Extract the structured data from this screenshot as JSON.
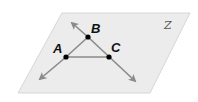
{
  "diagram": {
    "type": "geometry",
    "plane": {
      "label": "Z",
      "fill": "#ececec",
      "stroke": "#d0d0d0",
      "corners": [
        [
          62,
          13
        ],
        [
          190,
          13
        ],
        [
          150,
          93
        ],
        [
          18,
          93
        ]
      ]
    },
    "points": [
      {
        "name": "A",
        "x": 66,
        "y": 57
      },
      {
        "name": "B",
        "x": 88,
        "y": 37
      },
      {
        "name": "C",
        "x": 109,
        "y": 57
      }
    ],
    "segments": [
      {
        "from": "A",
        "to": "C",
        "color": "#8a8a8a"
      },
      {
        "from": "A",
        "to": "B",
        "color": "#8a8a8a"
      }
    ],
    "rays": [
      {
        "description": "line through A and B",
        "ends": [
          [
            40,
            79
          ],
          [
            72,
            23
          ]
        ],
        "color": "#8a8a8a"
      },
      {
        "description": "line through B and C",
        "ends": [
          [
            72,
            23
          ],
          [
            135,
            81
          ]
        ],
        "color": "#8a8a8a"
      }
    ],
    "labels": {
      "A": "A",
      "B": "B",
      "C": "C",
      "plane": "Z"
    }
  }
}
